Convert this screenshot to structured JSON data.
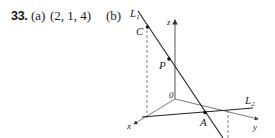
{
  "problem": {
    "number": "33.",
    "part_a_label": "(a)",
    "part_a_answer": "(2, 1, 4)",
    "part_b_label": "(b)"
  },
  "figure": {
    "labels": {
      "L1": "L",
      "L1_sub": "1",
      "L2": "L",
      "L2_sub": "2",
      "C": "C",
      "P": "P",
      "A": "A",
      "origin": "0",
      "x": "x",
      "y": "y",
      "z": "z"
    },
    "colors": {
      "ink": "#222222",
      "axis": "#555555"
    }
  }
}
